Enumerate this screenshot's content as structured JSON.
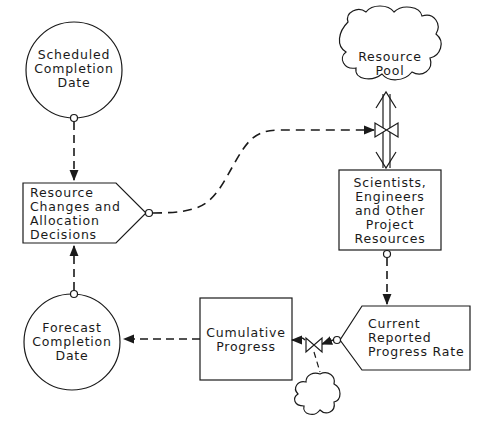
{
  "diagram": {
    "type": "system-dynamics flow diagram",
    "nodes": {
      "scheduled_completion_date": {
        "label": "Scheduled\nCompletion\nDate",
        "shape": "circle"
      },
      "resource_changes": {
        "label": "Resource\nChanges and\nAllocation\nDecisions",
        "shape": "pentagon-arrow"
      },
      "resource_pool": {
        "label": "Resource\nPool",
        "shape": "cloud"
      },
      "scientists_engineers": {
        "label": "Scientists,\nEngineers\nand Other\nProject\nResources",
        "shape": "rectangle"
      },
      "current_reported_progress_rate": {
        "label": "Current\nReported\nProgress Rate",
        "shape": "pentagon-arrow-left"
      },
      "cumulative_progress": {
        "label": "Cumulative\nProgress",
        "shape": "rectangle"
      },
      "forecast_completion_date": {
        "label": "Forecast\nCompletion\nDate",
        "shape": "circle"
      },
      "source_cloud": {
        "label": "",
        "shape": "cloud"
      }
    },
    "edges": [
      {
        "from": "scheduled_completion_date",
        "to": "resource_changes",
        "style": "dashed-info"
      },
      {
        "from": "forecast_completion_date",
        "to": "resource_changes",
        "style": "dashed-info"
      },
      {
        "from": "resource_changes",
        "to": "resource_pool_valve",
        "style": "dashed-info"
      },
      {
        "from": "resource_pool",
        "to": "scientists_engineers",
        "style": "double-flow-bidirectional",
        "valve": true
      },
      {
        "from": "scientists_engineers",
        "to": "current_reported_progress_rate",
        "style": "dashed-info"
      },
      {
        "from": "current_reported_progress_rate",
        "to": "progress_valve",
        "style": "dashed-info"
      },
      {
        "from": "source_cloud",
        "to": "cumulative_progress",
        "style": "flow",
        "valve": true
      },
      {
        "from": "cumulative_progress",
        "to": "forecast_completion_date",
        "style": "dashed-info"
      }
    ],
    "colors": {
      "line": "#1a1a1a",
      "background": "#ffffff"
    }
  }
}
